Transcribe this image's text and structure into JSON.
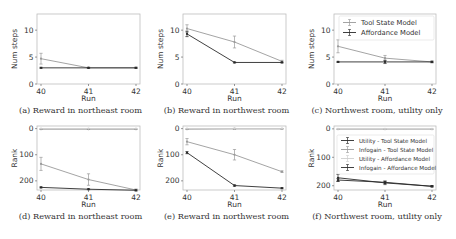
{
  "figure": {
    "width": 456,
    "height": 239
  },
  "chart_data": [
    {
      "id": "a",
      "type": "line",
      "caption": "(a) Reward in northeast room",
      "xlabel": "Run",
      "ylabel": "Num steps",
      "x": [
        40,
        41,
        42
      ],
      "xticks": [
        "40",
        "41",
        "42"
      ],
      "yticks": [
        0,
        5,
        10
      ],
      "ylim": [
        0,
        13
      ],
      "grid": false,
      "box": {
        "left": 37,
        "right": 140,
        "top": 14,
        "bottom": 84
      },
      "series": [
        {
          "name": "Tool State Model",
          "color": "#9a9a9a",
          "values": [
            4.7,
            3.0,
            3.0
          ],
          "err": [
            1.0,
            0.1,
            0.1
          ]
        },
        {
          "name": "Affordance Model",
          "color": "#2a2a2a",
          "values": [
            3.0,
            3.0,
            3.0
          ],
          "err": [
            0.1,
            0.1,
            0.1
          ]
        }
      ]
    },
    {
      "id": "b",
      "type": "line",
      "caption": "(b) Reward in northwest room",
      "xlabel": "Run",
      "ylabel": "Num steps",
      "x": [
        40,
        41,
        42
      ],
      "xticks": [
        "40",
        "41",
        "42"
      ],
      "yticks": [
        0,
        5,
        10
      ],
      "ylim": [
        0,
        13
      ],
      "grid": false,
      "box": {
        "left": 183,
        "right": 286,
        "top": 14,
        "bottom": 84
      },
      "series": [
        {
          "name": "Tool State Model",
          "color": "#9a9a9a",
          "values": [
            10.3,
            7.8,
            4.2
          ],
          "err": [
            0.7,
            1.1,
            0.2
          ]
        },
        {
          "name": "Affordance Model",
          "color": "#2a2a2a",
          "values": [
            9.3,
            4.0,
            4.0
          ],
          "err": [
            0.5,
            0.1,
            0.1
          ]
        }
      ]
    },
    {
      "id": "c",
      "type": "line",
      "caption": "(c) Northwest room, utility only",
      "xlabel": "Run",
      "ylabel": "Num steps",
      "x": [
        40,
        41,
        42
      ],
      "xticks": [
        "40",
        "41",
        "42"
      ],
      "yticks": [
        0,
        5,
        10
      ],
      "ylim": [
        0,
        13
      ],
      "grid": false,
      "legend_position": "upper right",
      "box": {
        "left": 334,
        "right": 436,
        "top": 14,
        "bottom": 84
      },
      "series": [
        {
          "name": "Tool State Model",
          "color": "#9a9a9a",
          "values": [
            7.0,
            4.8,
            4.1
          ],
          "err": [
            1.2,
            0.5,
            0.2
          ]
        },
        {
          "name": "Affordance Model",
          "color": "#2a2a2a",
          "values": [
            4.1,
            4.1,
            4.1
          ],
          "err": [
            0.1,
            0.3,
            0.1
          ]
        }
      ]
    },
    {
      "id": "d",
      "type": "line",
      "caption": "(d) Reward in northeast room",
      "xlabel": "Run",
      "ylabel": "Rank",
      "x": [
        40,
        41,
        42
      ],
      "xticks": [
        "40",
        "41",
        "42"
      ],
      "yticks": [
        0,
        100,
        200
      ],
      "ylim": [
        235,
        -10
      ],
      "inverted_y": true,
      "grid": false,
      "box": {
        "left": 37,
        "right": 140,
        "top": 126,
        "bottom": 190
      },
      "series": [
        {
          "name": "Utility - Tool State Model",
          "color": "#8a8a8a",
          "values": [
            2,
            2,
            2
          ],
          "err": [
            1,
            1,
            1
          ]
        },
        {
          "name": "Infogain - Tool State Model",
          "color": "#9a9a9a",
          "values": [
            135,
            195,
            235
          ],
          "err": [
            25,
            22,
            4
          ]
        },
        {
          "name": "Utility - Affordance Model",
          "color": "#cfcfcf",
          "values": [
            0,
            0,
            0
          ],
          "err": [
            0,
            0,
            0
          ]
        },
        {
          "name": "Infogain - Affordance Model",
          "color": "#2a2a2a",
          "values": [
            225,
            232,
            236
          ],
          "err": [
            2,
            2,
            2
          ]
        }
      ]
    },
    {
      "id": "e",
      "type": "line",
      "caption": "(e) Reward in northwest room",
      "xlabel": "Run",
      "ylabel": "Rank",
      "x": [
        40,
        41,
        42
      ],
      "xticks": [
        "40",
        "41",
        "42"
      ],
      "yticks": [
        0,
        100,
        200
      ],
      "ylim": [
        235,
        -10
      ],
      "inverted_y": true,
      "grid": false,
      "box": {
        "left": 183,
        "right": 286,
        "top": 126,
        "bottom": 190
      },
      "series": [
        {
          "name": "Utility - Tool State Model",
          "color": "#8a8a8a",
          "values": [
            2,
            1,
            1
          ],
          "err": [
            1,
            2,
            1
          ]
        },
        {
          "name": "Infogain - Tool State Model",
          "color": "#9a9a9a",
          "values": [
            50,
            100,
            165
          ],
          "err": [
            12,
            20,
            3
          ]
        },
        {
          "name": "Utility - Affordance Model",
          "color": "#cfcfcf",
          "values": [
            0,
            0,
            0
          ],
          "err": [
            0,
            0,
            0
          ]
        },
        {
          "name": "Infogain - Affordance Model",
          "color": "#2a2a2a",
          "values": [
            92,
            218,
            228
          ],
          "err": [
            4,
            3,
            2
          ]
        }
      ]
    },
    {
      "id": "f",
      "type": "line",
      "caption": "(f) Northwest room, utility only",
      "xlabel": "Run",
      "ylabel": "Rank",
      "x": [
        40,
        41,
        42
      ],
      "xticks": [
        "40",
        "41",
        "42"
      ],
      "yticks": [
        0,
        100,
        200
      ],
      "ylim": [
        215,
        -10
      ],
      "inverted_y": true,
      "grid": false,
      "legend_position": "center",
      "box": {
        "left": 334,
        "right": 436,
        "top": 126,
        "bottom": 190
      },
      "series": [
        {
          "name": "Utility - Tool State Model",
          "color": "#2a2a2a",
          "values": [
            172,
            190,
            202
          ],
          "err": [
            12,
            6,
            2
          ]
        },
        {
          "name": "Infogain - Tool State Model",
          "color": "#9a9a9a",
          "values": [
            1,
            1,
            1
          ],
          "err": [
            1,
            1,
            1
          ]
        },
        {
          "name": "Utility - Affordance Model",
          "color": "#cfcfcf",
          "values": [
            0,
            0,
            0
          ],
          "err": [
            0,
            0,
            0
          ]
        },
        {
          "name": "Infogain - Affordance Model",
          "color": "#2a2a2a",
          "values": [
            180,
            188,
            202
          ],
          "err": [
            5,
            4,
            2
          ]
        }
      ]
    }
  ],
  "legends": {
    "c": [
      {
        "label": "Tool State Model",
        "color": "#9a9a9a"
      },
      {
        "label": "Affordance Model",
        "color": "#2a2a2a"
      }
    ],
    "f": [
      {
        "label": "Utility - Tool State Model",
        "color": "#2a2a2a"
      },
      {
        "label": "Infogain - Tool State Model",
        "color": "#9a9a9a"
      },
      {
        "label": "Utility - Affordance Model",
        "color": "#cfcfcf"
      },
      {
        "label": "Infogain - Affordance Model",
        "color": "#2a2a2a"
      }
    ]
  }
}
